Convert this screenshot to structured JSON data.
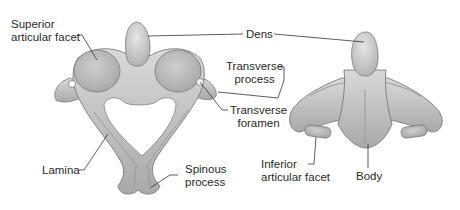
{
  "figure": {
    "views": [
      {
        "id": "superior-view",
        "name": "Atlas/Axis superior view"
      },
      {
        "id": "anterior-view",
        "name": "Axis anterior view"
      }
    ],
    "labels": {
      "superior_articular_facet": {
        "line1": "Superior",
        "line2": "articular facet"
      },
      "dens": {
        "line1": "Dens"
      },
      "transverse_process": {
        "line1": "Transverse",
        "line2": "process"
      },
      "transverse_foramen": {
        "line1": "Transverse",
        "line2": "foramen"
      },
      "lamina": {
        "line1": "Lamina"
      },
      "spinous_process": {
        "line1": "Spinous",
        "line2": "process"
      },
      "inferior_articular_facet": {
        "line1": "Inferior",
        "line2": "articular facet"
      },
      "body": {
        "line1": "Body"
      }
    },
    "colors": {
      "bone_light": "#d4d4d4",
      "bone_mid": "#b5b5b5",
      "bone_dark": "#8f8f8f",
      "outline": "#7a7a7a",
      "leader": "#333333",
      "text": "#2a2a2a"
    }
  }
}
